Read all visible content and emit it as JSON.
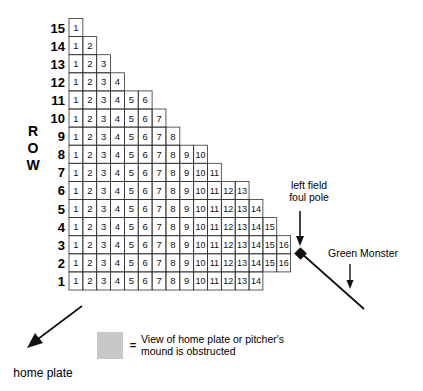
{
  "axis_label": [
    "R",
    "O",
    "W"
  ],
  "rows": [
    {
      "row": "15",
      "seats": 1
    },
    {
      "row": "14",
      "seats": 2
    },
    {
      "row": "13",
      "seats": 3
    },
    {
      "row": "12",
      "seats": 4
    },
    {
      "row": "11",
      "seats": 6
    },
    {
      "row": "10",
      "seats": 7
    },
    {
      "row": "9",
      "seats": 8
    },
    {
      "row": "8",
      "seats": 10
    },
    {
      "row": "7",
      "seats": 11
    },
    {
      "row": "6",
      "seats": 13
    },
    {
      "row": "5",
      "seats": 14
    },
    {
      "row": "4",
      "seats": 15
    },
    {
      "row": "3",
      "seats": 16
    },
    {
      "row": "2",
      "seats": 16
    },
    {
      "row": "1",
      "seats": 14
    }
  ],
  "obstructed_seats": {
    "9": [
      6,
      7,
      8
    ],
    "8": [
      5,
      6,
      7,
      8,
      9
    ],
    "7": [
      4,
      5,
      6,
      7,
      8
    ],
    "6": [
      2,
      3,
      4,
      5,
      6
    ],
    "5": [
      1,
      2,
      3,
      4
    ],
    "4": [
      1,
      2
    ]
  },
  "labels": {
    "foul_pole": [
      "left field",
      "foul pole"
    ],
    "green_monster": "Green Monster",
    "home_plate": "home plate",
    "legend_eq": "=",
    "legend_text": [
      "View of home plate or pitcher's",
      "mound is obstructed"
    ]
  },
  "colors": {
    "shade": "#c8c8c8",
    "grid": "#333333",
    "ink": "#111111"
  }
}
